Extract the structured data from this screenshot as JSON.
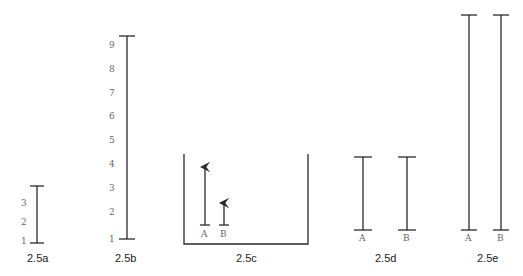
{
  "figures": [
    {
      "id": "2.5a",
      "caption": "2.5a",
      "scale_labels": [
        "3",
        "2",
        "1"
      ]
    },
    {
      "id": "2.5b",
      "caption": "2.5b",
      "scale_labels": [
        "9",
        "8",
        "7",
        "6",
        "5",
        "4",
        "3",
        "2",
        "1"
      ]
    },
    {
      "id": "2.5c",
      "caption": "2.5c",
      "scale_labels": [
        "5",
        "4",
        "3",
        "2",
        "1"
      ],
      "bar_labels": [
        "A",
        "B"
      ]
    },
    {
      "id": "2.5d",
      "caption": "2.5d",
      "bar_labels": [
        "A",
        "B"
      ]
    },
    {
      "id": "2.5e",
      "caption": "2.5e",
      "bar_labels": [
        "A",
        "B"
      ]
    }
  ],
  "colors": {
    "line": "#2a2a2a",
    "scale_text": "#666666",
    "caption_text": "#222222"
  }
}
